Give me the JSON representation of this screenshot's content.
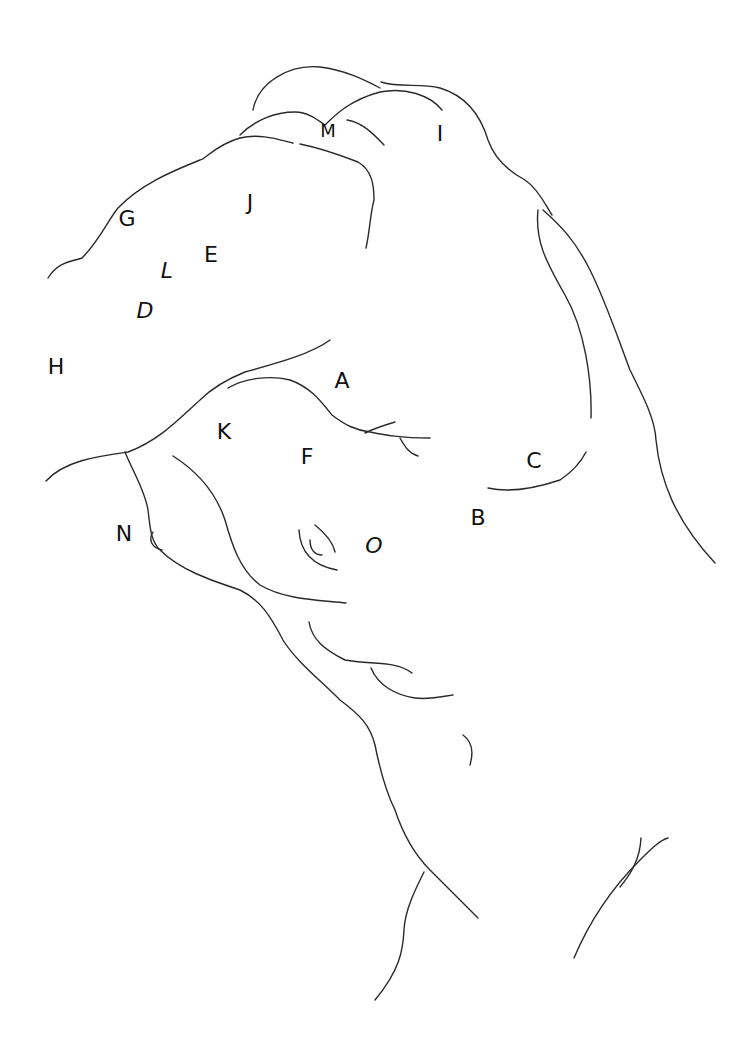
{
  "diagram": {
    "type": "anatomical-line-drawing",
    "stroke_color": "#2a2a2a",
    "background": "#ffffff",
    "labels": [
      {
        "id": "A",
        "text": "A",
        "x": 342,
        "y": 381
      },
      {
        "id": "B",
        "text": "B",
        "x": 478,
        "y": 518
      },
      {
        "id": "C",
        "text": "C",
        "x": 534,
        "y": 461
      },
      {
        "id": "D",
        "text": "D",
        "x": 145,
        "y": 311
      },
      {
        "id": "E",
        "text": "E",
        "x": 211,
        "y": 255
      },
      {
        "id": "F",
        "text": "F",
        "x": 307,
        "y": 457
      },
      {
        "id": "G",
        "text": "G",
        "x": 127,
        "y": 219
      },
      {
        "id": "H",
        "text": "H",
        "x": 56,
        "y": 367
      },
      {
        "id": "I",
        "text": "I",
        "x": 440,
        "y": 134
      },
      {
        "id": "J",
        "text": "J",
        "x": 250,
        "y": 203
      },
      {
        "id": "K",
        "text": "K",
        "x": 224,
        "y": 432
      },
      {
        "id": "L",
        "text": "L",
        "x": 167,
        "y": 271
      },
      {
        "id": "M",
        "text": "M",
        "x": 328,
        "y": 131
      },
      {
        "id": "N",
        "text": "N",
        "x": 124,
        "y": 534
      },
      {
        "id": "O",
        "text": "O",
        "x": 374,
        "y": 546
      }
    ]
  }
}
